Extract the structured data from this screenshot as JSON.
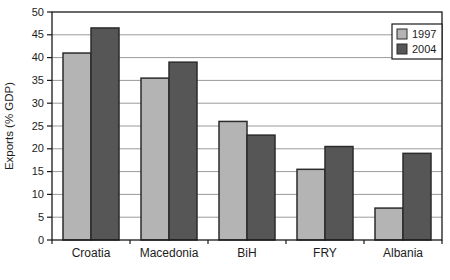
{
  "chart_data": {
    "type": "bar",
    "title": "",
    "xlabel": "",
    "ylabel": "Exports (% GDP)",
    "categories": [
      "Croatia",
      "Macedonia",
      "BiH",
      "FRY",
      "Albania"
    ],
    "series": [
      {
        "name": "1997",
        "color": "#b4b4b4",
        "values": [
          41,
          35.5,
          26,
          15.5,
          7
        ]
      },
      {
        "name": "2004",
        "color": "#565656",
        "values": [
          46.5,
          39,
          23,
          20.5,
          19
        ]
      }
    ],
    "ylim": [
      0,
      50
    ],
    "ytick_step": 5,
    "ytick_labels": [
      "0",
      "5",
      "10",
      "15",
      "20",
      "25",
      "30",
      "35",
      "40",
      "45",
      "50"
    ],
    "grid": "horizontal",
    "legend_position": "top-right",
    "legend_labels": [
      "1997",
      "2004"
    ],
    "colors": {
      "bar_outline": "#2b2b2b",
      "gridline": "#9a9a9a",
      "plot_border": "#1a1a1a",
      "background": "#ffffff",
      "text": "#1c1c1c"
    }
  }
}
